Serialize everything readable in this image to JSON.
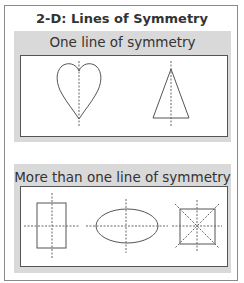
{
  "title": "2-D: Lines of Symmetry",
  "sections": [
    {
      "label": "One line of symmetry",
      "shapes": [
        {
          "name": "heart",
          "lines_of_symmetry": 1
        },
        {
          "name": "isosceles-triangle",
          "lines_of_symmetry": 1
        }
      ]
    },
    {
      "label": "More than one line of symmetry",
      "shapes": [
        {
          "name": "rectangle",
          "lines_of_symmetry": 2
        },
        {
          "name": "ellipse",
          "lines_of_symmetry": 2
        },
        {
          "name": "square",
          "lines_of_symmetry": 4
        }
      ]
    }
  ],
  "colors": {
    "panel": "#d9d9d9",
    "stroke": "#555555",
    "dashed": "#666666"
  }
}
